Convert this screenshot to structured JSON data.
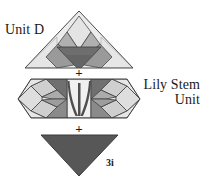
{
  "figure": {
    "background_color": "#ffffff"
  },
  "labels": {
    "unit_d": "Unit D",
    "lily_stem_unit_line1": "Lily Stem",
    "lily_stem_unit_line2": "Unit",
    "bottom_piece": "3i",
    "plus_top": "+",
    "plus_bottom": "+"
  },
  "palette": {
    "fabric_lightest": "#ececec",
    "fabric_light": "#dcdcdc",
    "fabric_mid_light": "#c6c6c6",
    "fabric_medium": "#a8a8a8",
    "fabric_dark": "#757575",
    "fabric_darkest": "#5a5a5a",
    "outline": "#3a3a3a",
    "text": "#1a1a1a"
  },
  "units": [
    {
      "name": "Unit D",
      "shape": "triangle-up",
      "order": 1,
      "description": "Large light triangle containing a centered lily motif with a light diamond bud, two medium petals and a dark base triangle"
    },
    {
      "name": "Lily Stem Unit",
      "shape": "elongated-hexagon",
      "order": 2,
      "description": "Horizontal band with a central light panel holding three dark curved stems, flanked left and right by mirrored lily petal motifs"
    },
    {
      "name": "3i",
      "shape": "triangle-down",
      "order": 3,
      "description": "Solid dark gray downward pointing triangle"
    }
  ]
}
